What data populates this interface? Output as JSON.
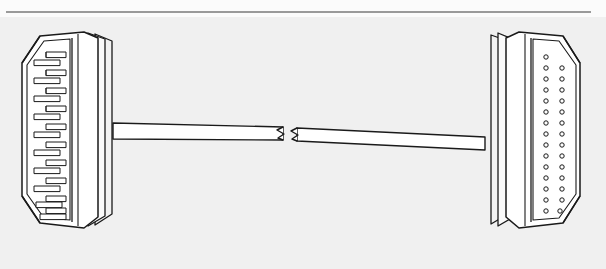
{
  "page": {
    "width": 606,
    "height": 269,
    "background_color": "#f0f0f0",
    "paper_color": "#fbfbfb",
    "title": "",
    "caption": ""
  },
  "top_rule": {
    "name": "horizontal-rule",
    "color": "#9a9a9a",
    "x": 6,
    "y": 11,
    "width": 585,
    "height": 2
  },
  "figure": {
    "type": "technical-line-drawing",
    "line_color": "#1a1a1a",
    "fill_color": "#ffffff",
    "shade_color": "#e8e8e8"
  },
  "left_connector": {
    "name": "male-scart-connector",
    "label": "",
    "orientation": "facing-left",
    "pin_rows": 2,
    "pins_per_row": 10,
    "pin_total": 20,
    "pin_style": "flat-blade",
    "x": 18,
    "y": 30,
    "width": 96,
    "height": 205
  },
  "right_connector": {
    "name": "female-scart-connector",
    "label": "",
    "orientation": "facing-right",
    "hole_rows": 2,
    "holes_per_row": 15,
    "hole_total": 30,
    "hole_style": "round-socket",
    "x": 484,
    "y": 30,
    "width": 96,
    "height": 205
  },
  "cable": {
    "name": "cable-run",
    "has_break_symbol": true,
    "break_symbol": "zigzag-pair",
    "break_x": 290,
    "left_attach_x": 114,
    "right_attach_x": 484,
    "stroke": "#1a1a1a"
  }
}
